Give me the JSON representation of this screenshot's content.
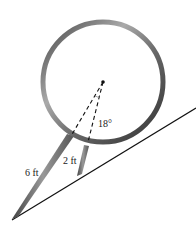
{
  "diagram": {
    "labels": {
      "long_leg": "6 ft",
      "short_leg": "2 ft",
      "angle": "18°"
    },
    "colors": {
      "ring_dark": "#555555",
      "ring_light": "#bbbbbb",
      "line": "#111111"
    }
  }
}
